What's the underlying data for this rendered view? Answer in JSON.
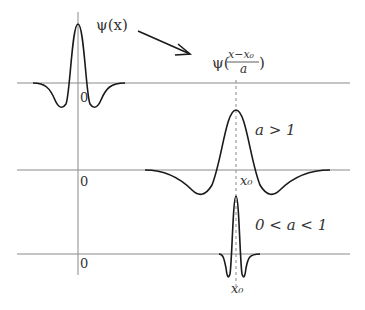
{
  "labels": {
    "psi_x": "ψ(x)",
    "psi_prefix": "ψ(",
    "frac_num": "x−x₀",
    "frac_den": "a",
    "psi_suffix": ")",
    "zero_top": "0",
    "zero_mid": "0",
    "zero_bot": "0",
    "case_large": "a > 1",
    "case_small": "0 < a < 1",
    "x0_mid": "x₀",
    "x0_bot": "x₀"
  },
  "colors": {
    "curve": "#1a1a1a",
    "axis": "#8a8a8a",
    "text": "#333333"
  }
}
